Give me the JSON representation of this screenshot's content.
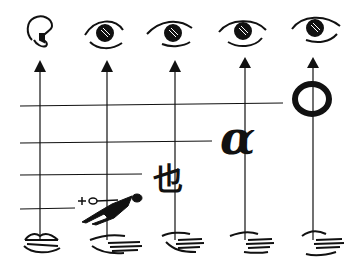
{
  "diagram": {
    "top_row": [
      {
        "icon": "ear-icon",
        "x": 40
      },
      {
        "icon": "eye-icon",
        "x": 107
      },
      {
        "icon": "eye-icon",
        "x": 175
      },
      {
        "icon": "eye-icon",
        "x": 245
      },
      {
        "icon": "eye-icon",
        "x": 313
      }
    ],
    "bottom_row": [
      {
        "icon": "lips-icon",
        "x": 40
      },
      {
        "icon": "hand-icon",
        "x": 107
      },
      {
        "icon": "hand-icon",
        "x": 175
      },
      {
        "icon": "hand-icon",
        "x": 245
      },
      {
        "icon": "hand-icon",
        "x": 313
      }
    ],
    "horizontal_levels": [
      {
        "y": 105,
        "x_end": 283
      },
      {
        "y": 142,
        "x_end": 212
      },
      {
        "y": 174,
        "x_end": 142
      },
      {
        "y": 208,
        "x_end": 75
      }
    ],
    "signs": [
      {
        "name": "pictogram-figure",
        "label": "figure with object"
      },
      {
        "name": "ideogram-character",
        "label": "也"
      },
      {
        "name": "letter-alpha",
        "label": "α"
      },
      {
        "name": "letter-o",
        "label": "O"
      }
    ],
    "stroke_color": "#111111",
    "background_color": "#ffffff"
  }
}
